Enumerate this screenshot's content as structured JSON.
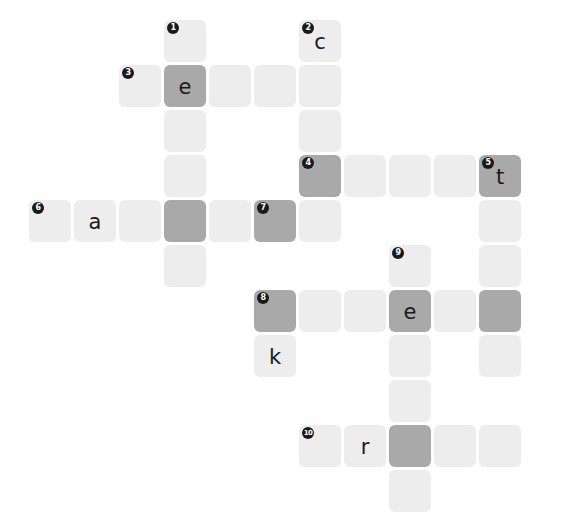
{
  "puzzle": {
    "title": "Crossword Grid",
    "type": "crossword",
    "grid": {
      "cell_size": 42,
      "pitch": 45,
      "origin_x": 29,
      "origin_y": 20,
      "columns": 11,
      "rows": 11
    },
    "colors": {
      "background": "#ffffff",
      "cell_light": "#ededed",
      "cell_shaded": "#a9a9a9",
      "number_badge": "#1a1a1a",
      "number_text": "#ffffff",
      "letter_text": "#1a1a1a"
    },
    "letters_filled": [
      "e",
      "c",
      "a",
      "t",
      "k",
      "e",
      "r"
    ],
    "clue_numbers": [
      1,
      2,
      3,
      4,
      5,
      6,
      7,
      8,
      9,
      10
    ],
    "cells": [
      {
        "id": "c-r0-x3",
        "col": 3,
        "row": 0,
        "shaded": false,
        "number": "1",
        "letter": ""
      },
      {
        "id": "c-r0-x6",
        "col": 6,
        "row": 0,
        "shaded": false,
        "number": "2",
        "letter": "c"
      },
      {
        "id": "c-r1-x2",
        "col": 2,
        "row": 1,
        "shaded": false,
        "number": "3",
        "letter": ""
      },
      {
        "id": "c-r1-x3",
        "col": 3,
        "row": 1,
        "shaded": true,
        "number": "",
        "letter": "e"
      },
      {
        "id": "c-r1-x4",
        "col": 4,
        "row": 1,
        "shaded": false,
        "number": "",
        "letter": ""
      },
      {
        "id": "c-r1-x5",
        "col": 5,
        "row": 1,
        "shaded": false,
        "number": "",
        "letter": ""
      },
      {
        "id": "c-r1-x6",
        "col": 6,
        "row": 1,
        "shaded": false,
        "number": "",
        "letter": ""
      },
      {
        "id": "c-r2-x3",
        "col": 3,
        "row": 2,
        "shaded": false,
        "number": "",
        "letter": ""
      },
      {
        "id": "c-r2-x6",
        "col": 6,
        "row": 2,
        "shaded": false,
        "number": "",
        "letter": ""
      },
      {
        "id": "c-r3-x3",
        "col": 3,
        "row": 3,
        "shaded": false,
        "number": "",
        "letter": ""
      },
      {
        "id": "c-r3-x6",
        "col": 6,
        "row": 3,
        "shaded": true,
        "number": "4",
        "letter": ""
      },
      {
        "id": "c-r3-x7",
        "col": 7,
        "row": 3,
        "shaded": false,
        "number": "",
        "letter": ""
      },
      {
        "id": "c-r3-x8",
        "col": 8,
        "row": 3,
        "shaded": false,
        "number": "",
        "letter": ""
      },
      {
        "id": "c-r3-x9",
        "col": 9,
        "row": 3,
        "shaded": false,
        "number": "",
        "letter": ""
      },
      {
        "id": "c-r3-x10",
        "col": 10,
        "row": 3,
        "shaded": true,
        "number": "5",
        "letter": "t"
      },
      {
        "id": "c-r4-x0",
        "col": 0,
        "row": 4,
        "shaded": false,
        "number": "6",
        "letter": ""
      },
      {
        "id": "c-r4-x1",
        "col": 1,
        "row": 4,
        "shaded": false,
        "number": "",
        "letter": "a"
      },
      {
        "id": "c-r4-x2",
        "col": 2,
        "row": 4,
        "shaded": false,
        "number": "",
        "letter": ""
      },
      {
        "id": "c-r4-x3",
        "col": 3,
        "row": 4,
        "shaded": true,
        "number": "",
        "letter": ""
      },
      {
        "id": "c-r4-x4",
        "col": 4,
        "row": 4,
        "shaded": false,
        "number": "",
        "letter": ""
      },
      {
        "id": "c-r4-x5",
        "col": 5,
        "row": 4,
        "shaded": true,
        "number": "7",
        "letter": ""
      },
      {
        "id": "c-r4-x6",
        "col": 6,
        "row": 4,
        "shaded": false,
        "number": "",
        "letter": ""
      },
      {
        "id": "c-r4-x10",
        "col": 10,
        "row": 4,
        "shaded": false,
        "number": "",
        "letter": ""
      },
      {
        "id": "c-r5-x3",
        "col": 3,
        "row": 5,
        "shaded": false,
        "number": "",
        "letter": ""
      },
      {
        "id": "c-r5-x8",
        "col": 8,
        "row": 5,
        "shaded": false,
        "number": "9",
        "letter": ""
      },
      {
        "id": "c-r5-x10",
        "col": 10,
        "row": 5,
        "shaded": false,
        "number": "",
        "letter": ""
      },
      {
        "id": "c-r6-x5",
        "col": 5,
        "row": 6,
        "shaded": true,
        "number": "8",
        "letter": ""
      },
      {
        "id": "c-r6-x6",
        "col": 6,
        "row": 6,
        "shaded": false,
        "number": "",
        "letter": ""
      },
      {
        "id": "c-r6-x7",
        "col": 7,
        "row": 6,
        "shaded": false,
        "number": "",
        "letter": ""
      },
      {
        "id": "c-r6-x8",
        "col": 8,
        "row": 6,
        "shaded": true,
        "number": "",
        "letter": "e"
      },
      {
        "id": "c-r6-x9",
        "col": 9,
        "row": 6,
        "shaded": false,
        "number": "",
        "letter": ""
      },
      {
        "id": "c-r6-x10",
        "col": 10,
        "row": 6,
        "shaded": true,
        "number": "",
        "letter": ""
      },
      {
        "id": "c-r7-x5",
        "col": 5,
        "row": 7,
        "shaded": false,
        "number": "",
        "letter": "k"
      },
      {
        "id": "c-r7-x8",
        "col": 8,
        "row": 7,
        "shaded": false,
        "number": "",
        "letter": ""
      },
      {
        "id": "c-r7-x10",
        "col": 10,
        "row": 7,
        "shaded": false,
        "number": "",
        "letter": ""
      },
      {
        "id": "c-r8-x8",
        "col": 8,
        "row": 8,
        "shaded": false,
        "number": "",
        "letter": ""
      },
      {
        "id": "c-r9-x6",
        "col": 6,
        "row": 9,
        "shaded": false,
        "number": "10",
        "letter": ""
      },
      {
        "id": "c-r9-x7",
        "col": 7,
        "row": 9,
        "shaded": false,
        "number": "",
        "letter": "r"
      },
      {
        "id": "c-r9-x8",
        "col": 8,
        "row": 9,
        "shaded": true,
        "number": "",
        "letter": ""
      },
      {
        "id": "c-r9-x9",
        "col": 9,
        "row": 9,
        "shaded": false,
        "number": "",
        "letter": ""
      },
      {
        "id": "c-r9-x10",
        "col": 10,
        "row": 9,
        "shaded": false,
        "number": "",
        "letter": ""
      },
      {
        "id": "c-r10-x8",
        "col": 8,
        "row": 10,
        "shaded": false,
        "number": "",
        "letter": ""
      }
    ]
  }
}
